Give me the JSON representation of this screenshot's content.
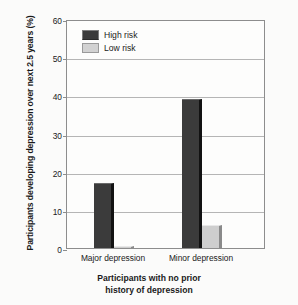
{
  "chart_data": {
    "type": "bar",
    "title": "",
    "categories": [
      "Major depression",
      "Minor depression"
    ],
    "series": [
      {
        "name": "High risk",
        "values": [
          17,
          39
        ],
        "color": "#3b3b3b"
      },
      {
        "name": "Low risk",
        "values": [
          0.5,
          6
        ],
        "color": "#cecece"
      }
    ],
    "xlabel_lines": [
      "Participants with no prior",
      "history of depression"
    ],
    "ylabel": "Participants developing depression over next 2.5 years (%)",
    "ylim": [
      0,
      60
    ],
    "yticks": [
      "0",
      "10",
      "20",
      "30",
      "40",
      "50",
      "60"
    ],
    "grid": true,
    "legend_position": "top-left"
  }
}
